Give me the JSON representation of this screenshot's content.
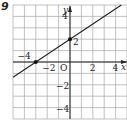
{
  "problem_number": "9",
  "chart_data": {
    "type": "line",
    "title": "",
    "xlabel": "x",
    "ylabel": "y",
    "origin_label": "O",
    "xlim": [
      -5,
      5
    ],
    "ylim": [
      -5,
      5
    ],
    "grid": true,
    "x_tick_labels": [
      "-4",
      "-2",
      "2",
      "4"
    ],
    "y_tick_labels": [
      "4",
      "2",
      "-2",
      "-4"
    ],
    "series": [
      {
        "name": "line",
        "equation": "y = (2/3)x + 2",
        "x": [
          -5,
          4.5
        ],
        "y": [
          -1.333,
          5
        ]
      }
    ],
    "points": [
      {
        "x": -3,
        "y": 0
      },
      {
        "x": 0,
        "y": 2
      }
    ]
  }
}
